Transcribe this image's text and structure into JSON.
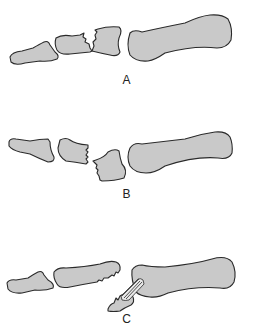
{
  "figure": {
    "colors": {
      "bone_fill": "#c9c9c9",
      "outline": "#2a2a2a",
      "background": "#ffffff"
    },
    "panels": [
      {
        "id": "A",
        "label": "A",
        "description": "Fracture through base of middle phalanx with jagged split, fragments aligned"
      },
      {
        "id": "B",
        "label": "B",
        "description": "Middle phalanx base fracture with displaced fragment"
      },
      {
        "id": "C",
        "label": "C",
        "description": "Avulsion fracture with tendon attached to displaced fragment near proximal phalanx"
      }
    ]
  }
}
